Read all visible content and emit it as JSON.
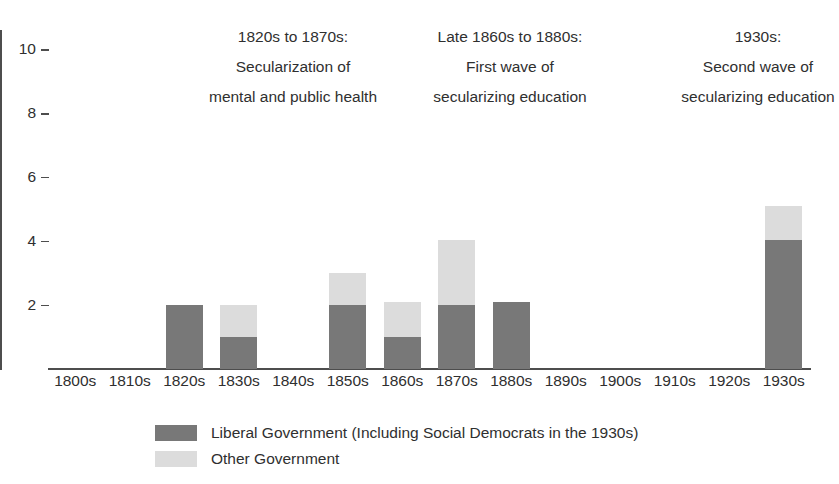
{
  "chart_data": {
    "type": "bar",
    "title": "",
    "xlabel": "",
    "ylabel": "",
    "stacked": true,
    "grid": false,
    "legend_position": "bottom",
    "ylim": [
      0,
      10.6
    ],
    "yticks": [
      2,
      4,
      6,
      8,
      10
    ],
    "ytick_labels": [
      "2",
      "4",
      "6",
      "8",
      "10"
    ],
    "categories": [
      "1800s",
      "1810s",
      "1820s",
      "1830s",
      "1840s",
      "1850s",
      "1860s",
      "1870s",
      "1880s",
      "1890s",
      "1900s",
      "1910s",
      "1920s",
      "1930s"
    ],
    "series": [
      {
        "name": "Liberal Government (Including Social Democrats in the 1930s)",
        "color": "#787878",
        "values": [
          0,
          0,
          2,
          1,
          0,
          2,
          1,
          2,
          2.1,
          0,
          0,
          0,
          0,
          4.05
        ]
      },
      {
        "name": "Other Government",
        "color": "#dcdcdc",
        "values": [
          0,
          0,
          0,
          1,
          0,
          1,
          1.1,
          2.05,
          0,
          0,
          0,
          0,
          0,
          1.05
        ]
      }
    ],
    "totals": [
      0,
      0,
      2,
      2,
      0,
      3,
      2.1,
      4.05,
      2.1,
      0,
      0,
      0,
      0,
      5.1
    ],
    "annotations": [
      {
        "lines": [
          "1820s to 1870s:",
          "Secularization of",
          "mental and public health"
        ]
      },
      {
        "lines": [
          "Late 1860s to 1880s:",
          "First wave of",
          "secularizing education"
        ]
      },
      {
        "lines": [
          "1930s:",
          "Second wave of",
          "secularizing education"
        ]
      }
    ],
    "legend": [
      {
        "label": "Liberal Government (Including Social Democrats in the 1930s)",
        "color": "#787878"
      },
      {
        "label": "Other Government",
        "color": "#dcdcdc"
      }
    ],
    "axis_color": "#4d4d4d",
    "background": "#ffffff"
  }
}
